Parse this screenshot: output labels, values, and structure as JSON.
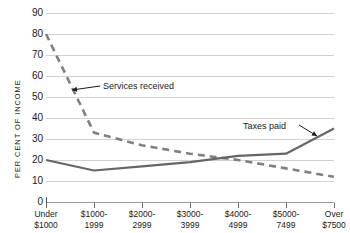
{
  "chart_data": {
    "type": "line",
    "title": "",
    "xlabel": "",
    "ylabel": "PER CENT OF INCOME",
    "ylim": [
      0,
      90
    ],
    "yticks": [
      0,
      10,
      20,
      30,
      40,
      50,
      60,
      70,
      80,
      90
    ],
    "grid": true,
    "legend_position": "inline-annotations",
    "categories": [
      "Under $1000",
      "$1000-1999",
      "$2000-2999",
      "$3000-3999",
      "$4000-4999",
      "$5000-7499",
      "Over $7500"
    ],
    "category_lines": [
      [
        "Under",
        "$1000"
      ],
      [
        "$1000-",
        "1999"
      ],
      [
        "$2000-",
        "2999"
      ],
      [
        "$3000-",
        "3999"
      ],
      [
        "$4000-",
        "4999"
      ],
      [
        "$5000-",
        "7499"
      ],
      [
        "Over",
        "$7500"
      ]
    ],
    "series": [
      {
        "name": "Services received",
        "style": "dashed",
        "color": "#808080",
        "values": [
          80,
          33,
          27,
          23,
          20,
          16,
          12
        ]
      },
      {
        "name": "Taxes paid",
        "style": "solid",
        "color": "#666666",
        "values": [
          20,
          15,
          17,
          19,
          22,
          23,
          35
        ]
      }
    ],
    "annotations": [
      {
        "text": "Services received",
        "points_to_series": "Services received"
      },
      {
        "text": "Taxes paid",
        "points_to_series": "Taxes paid"
      }
    ]
  },
  "axis": {
    "y_title": "PER CENT OF INCOME",
    "y_tick_labels": [
      "90",
      "80",
      "70",
      "60",
      "50",
      "40",
      "30",
      "20",
      "10",
      "0"
    ]
  },
  "annotations": {
    "services": "Services received",
    "taxes": "Taxes paid"
  }
}
